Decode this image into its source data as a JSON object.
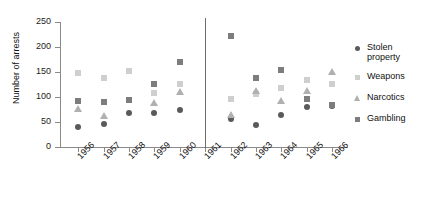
{
  "chart_data": {
    "type": "scatter",
    "title": "",
    "xlabel": "",
    "ylabel": "Number of arrests",
    "ylim": [
      0,
      250
    ],
    "yticks": [
      0,
      50,
      100,
      150,
      200,
      250
    ],
    "ytick_labels": [
      "0",
      "50",
      "100",
      "150",
      "200",
      "250"
    ],
    "grid": false,
    "legend_position": "right",
    "categories": [
      "1956",
      "1957",
      "1958",
      "1959",
      "1960",
      "1961",
      "1962",
      "1963",
      "1964",
      "1965",
      "1966"
    ],
    "divider_at": "1961",
    "divider_note": "vertical rule separating 1956-1960 from 1962-1966; no data plotted at 1961",
    "series": [
      {
        "name": "Stolen property",
        "marker": "circle",
        "color": "#5a5a5a",
        "values": [
          41,
          47,
          69,
          68,
          74,
          null,
          57,
          45,
          64,
          81,
          83
        ]
      },
      {
        "name": "Weapons",
        "marker": "square",
        "color": "#cfcfcf",
        "values": [
          148,
          138,
          152,
          108,
          126,
          null,
          96,
          106,
          118,
          135,
          127
        ]
      },
      {
        "name": "Narcotics",
        "marker": "triangle",
        "color": "#b0b0b0",
        "values": [
          76,
          62,
          null,
          88,
          111,
          null,
          65,
          113,
          93,
          112,
          150
        ]
      },
      {
        "name": "Gambling",
        "marker": "square",
        "color": "#7d7d7d",
        "values": [
          92,
          91,
          94,
          127,
          171,
          null,
          223,
          138,
          155,
          97,
          85
        ]
      }
    ]
  },
  "legend": {
    "entries": [
      {
        "label": "Stolen property"
      },
      {
        "label": "Weapons"
      },
      {
        "label": "Narcotics"
      },
      {
        "label": "Gambling"
      }
    ]
  }
}
